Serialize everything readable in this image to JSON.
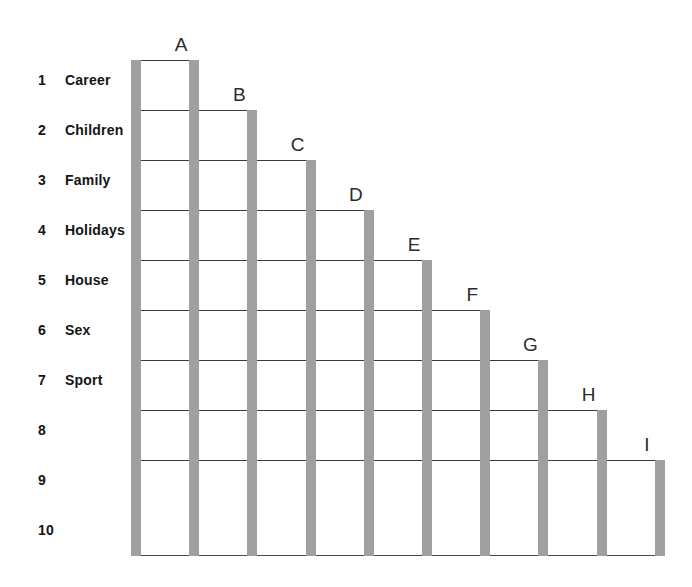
{
  "chart_data": {
    "type": "bar",
    "title": "",
    "subtitle": "",
    "xlabel": "",
    "ylabel": "",
    "grid": true,
    "legend_position": "none",
    "orientation": "descending-staircase",
    "axis_rows": [
      1,
      2,
      3,
      4,
      5,
      6,
      7,
      8,
      9,
      10
    ],
    "ylim": [
      1,
      10
    ],
    "categories": [
      "A",
      "B",
      "C",
      "D",
      "E",
      "F",
      "G",
      "H",
      "I"
    ],
    "values": [
      1,
      2,
      3,
      4,
      5,
      6,
      7,
      8,
      9
    ],
    "row_labels": [
      "Career",
      "Children",
      "Family",
      "Holidays",
      "House",
      "Sex",
      "Sport",
      "",
      "",
      ""
    ],
    "rows": [
      {
        "number": "1",
        "label": "Career"
      },
      {
        "number": "2",
        "label": "Children"
      },
      {
        "number": "3",
        "label": "Family"
      },
      {
        "number": "4",
        "label": "Holidays"
      },
      {
        "number": "5",
        "label": "House"
      },
      {
        "number": "6",
        "label": "Sex"
      },
      {
        "number": "7",
        "label": "Sport"
      },
      {
        "number": "8",
        "label": ""
      },
      {
        "number": "9",
        "label": ""
      },
      {
        "number": "10",
        "label": ""
      }
    ],
    "steps": [
      {
        "letter": "A",
        "level": 1
      },
      {
        "letter": "B",
        "level": 2
      },
      {
        "letter": "C",
        "level": 3
      },
      {
        "letter": "D",
        "level": 4
      },
      {
        "letter": "E",
        "level": 5
      },
      {
        "letter": "F",
        "level": 6
      },
      {
        "letter": "G",
        "level": 7
      },
      {
        "letter": "H",
        "level": 8
      },
      {
        "letter": "I",
        "level": 9
      }
    ],
    "colors": {
      "bar": "#a0a0a0",
      "line": "#3a3a3a",
      "text": "#141414",
      "letter": "#2b2b2b",
      "background": "#ffffff"
    }
  },
  "geometry": {
    "plot_left": 131,
    "bar_width": 10,
    "bar_spacing": 58.2,
    "row_height": 50,
    "first_line_y": 60,
    "baseline_y": 555,
    "bar_count": 10,
    "label_number_x": 38,
    "label_text_x": 65
  }
}
